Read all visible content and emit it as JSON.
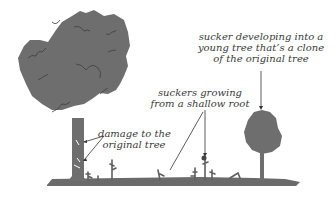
{
  "diagram": {
    "type": "illustration",
    "colors": {
      "tree_fill": "#6e6e6e",
      "ground": "#6a6a6a",
      "text": "#3a3a3a",
      "line": "#333333",
      "background": "#ffffff"
    },
    "labels": {
      "clone": {
        "line1": "sucker developing into a",
        "line2": "young tree that’s a clone",
        "line3": "of the original tree"
      },
      "suckers": {
        "line1": "suckers growing",
        "line2": "from a shallow root"
      },
      "damage": {
        "line1": "damage to the",
        "line2": "original tree"
      }
    },
    "elements": [
      "original-tree",
      "young-clone-tree",
      "ground-root",
      "suckers"
    ]
  }
}
